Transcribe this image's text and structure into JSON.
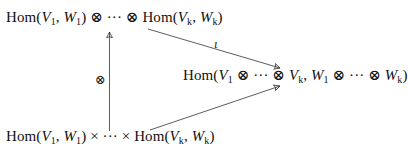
{
  "diagram": {
    "type": "commutative-diagram",
    "nodes": {
      "top": {
        "text": "Hom(V1, W1) ⊗ ··· ⊗ Hom(Vk, Wk)",
        "parts": {
          "hom": "Hom",
          "v1": "V",
          "v1_sub": "1",
          "w1": "W",
          "w1_sub": "1",
          "op": "⊗",
          "dots": "···",
          "vk": "V",
          "vk_sub": "k",
          "wk": "W",
          "wk_sub": "k"
        }
      },
      "right": {
        "text": "Hom(V1 ⊗ ··· ⊗ Vk, W1 ⊗ ··· ⊗ Wk)",
        "parts": {
          "hom": "Hom",
          "v1": "V",
          "v1_sub": "1",
          "op": "⊗",
          "dots": "···",
          "vk": "V",
          "vk_sub": "k",
          "w1": "W",
          "w1_sub": "1",
          "wk": "W",
          "wk_sub": "k"
        }
      },
      "bottom": {
        "text": "Hom(V1, W1) × ··· × Hom(Vk, Wk)",
        "parts": {
          "hom": "Hom",
          "v1": "V",
          "v1_sub": "1",
          "w1": "W",
          "w1_sub": "1",
          "op": "×",
          "dots": "···",
          "vk": "V",
          "vk_sub": "k",
          "wk": "W",
          "wk_sub": "k"
        }
      }
    },
    "edges": [
      {
        "from": "bottom",
        "to": "top",
        "label": "⊗"
      },
      {
        "from": "top",
        "to": "right",
        "label": "ι"
      },
      {
        "from": "bottom",
        "to": "right",
        "label": ""
      }
    ],
    "colors": {
      "text": "#111111",
      "arrow": "#333333",
      "background": "#ffffff"
    }
  }
}
